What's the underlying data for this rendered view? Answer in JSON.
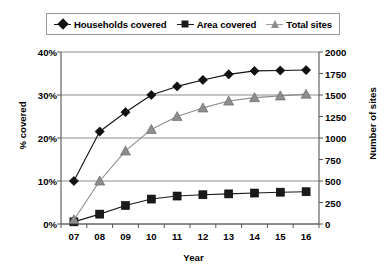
{
  "chart_data": {
    "type": "line",
    "title": "",
    "xlabel": "Year",
    "ylabel": "% covered",
    "y2label": "Number of sites",
    "categories": [
      "07",
      "08",
      "09",
      "10",
      "11",
      "12",
      "13",
      "14",
      "15",
      "16"
    ],
    "ylim": [
      0,
      40
    ],
    "y2lim": [
      0,
      2000
    ],
    "yticks": [
      "0%",
      "10%",
      "20%",
      "30%",
      "40%"
    ],
    "ytick_values": [
      0,
      10,
      20,
      30,
      40
    ],
    "y2ticks": [
      "0",
      "250",
      "500",
      "750",
      "1000",
      "1250",
      "1500",
      "1750",
      "2000"
    ],
    "y2tick_values": [
      0,
      250,
      500,
      750,
      1000,
      1250,
      1500,
      1750,
      2000
    ],
    "grid": true,
    "legend_position": "top",
    "series": [
      {
        "name": "Households covered",
        "axis": "left",
        "unit": "%",
        "marker": "diamond",
        "color": "#111111",
        "values": [
          10.0,
          21.5,
          26.0,
          30.0,
          32.0,
          33.5,
          34.8,
          35.6,
          35.7,
          35.8
        ]
      },
      {
        "name": "Area covered",
        "axis": "left",
        "unit": "%",
        "marker": "square",
        "color": "#1a1a1a",
        "values": [
          0.5,
          2.3,
          4.3,
          5.8,
          6.5,
          6.8,
          7.0,
          7.2,
          7.4,
          7.5
        ]
      },
      {
        "name": "Total sites",
        "axis": "right",
        "unit": "sites",
        "marker": "triangle",
        "color": "#8d8d8d",
        "values": [
          50,
          500,
          850,
          1100,
          1250,
          1350,
          1430,
          1470,
          1490,
          1510
        ]
      }
    ]
  },
  "legend": {
    "items": [
      {
        "label": "Households covered"
      },
      {
        "label": "Area covered"
      },
      {
        "label": "Total sites"
      }
    ]
  }
}
